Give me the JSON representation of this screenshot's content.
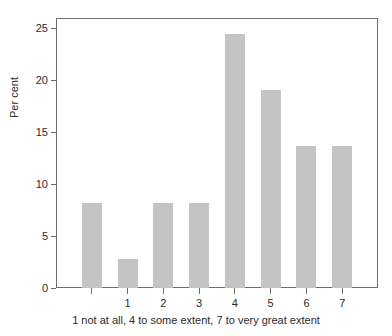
{
  "chart_data": {
    "type": "bar",
    "title": "",
    "subtitle": "",
    "xlabel": "1 not at all, 4 to some extent, 7 to very great extent",
    "ylabel": "Per cent",
    "categories": [
      "",
      "1",
      "2",
      "3",
      "4",
      "5",
      "6",
      "7"
    ],
    "values": [
      8.2,
      2.75,
      8.2,
      8.2,
      24.5,
      19.1,
      13.7,
      13.7
    ],
    "ylim": [
      0,
      26
    ],
    "yticks": [
      0,
      5,
      10,
      15,
      20,
      25
    ],
    "ytick_labels": [
      "0",
      "5",
      "10",
      "15",
      "20",
      "25"
    ],
    "xtick_labels": [
      "",
      "1",
      "2",
      "3",
      "4",
      "5",
      "6",
      "7"
    ],
    "grid": false,
    "legend": false,
    "legend_position": "none",
    "bar_color": "#c4c4c4",
    "axis_color": "#6e6e6e",
    "text_color": "#2b2b2b",
    "background_color": "#ffffff",
    "annotations": []
  }
}
